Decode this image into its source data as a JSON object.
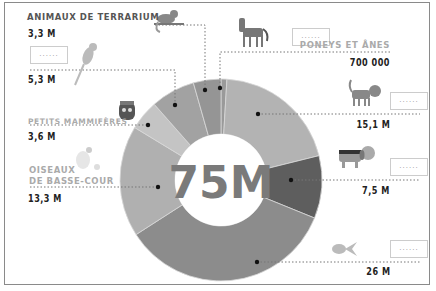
{
  "chart_data": {
    "type": "pie",
    "style": "donut",
    "title": "75M",
    "total_label": "75M",
    "categories": [
      "Poneys et ânes",
      "Chats",
      "Chiens",
      "Poissons",
      "Oiseaux de basse-cour",
      "Petits mammifères",
      "Oiseaux",
      "Animaux de terrarium"
    ],
    "values": [
      0.7,
      15.1,
      7.5,
      26,
      13.3,
      3.6,
      5.3,
      3.3
    ],
    "value_labels": [
      "700 000",
      "15,1 M",
      "7,5 M",
      "26 M",
      "13,3 M",
      "3,6 M",
      "5,3 M",
      "3,3 M"
    ],
    "colors": [
      "#9a9a9a",
      "#b3b3b3",
      "#5e5e5e",
      "#8c8c8c",
      "#b0b0b0",
      "#c4c4c4",
      "#a2a2a2",
      "#959595"
    ],
    "legend_position": "around, with leader lines"
  },
  "center": {
    "text": "75M"
  },
  "labels": {
    "terrarium": {
      "name": "ANIMAUX DE TERRARIUM",
      "value": "3,3 M"
    },
    "birds": {
      "name": "",
      "value": "5,3 M",
      "box": "......"
    },
    "small_mammals": {
      "name": "PETITS MAMMIFÈRES",
      "value": "3,6 M"
    },
    "poultry": {
      "name1": "OISEAUX",
      "name2": "DE BASSE-COUR",
      "value": "13,3 M"
    },
    "ponies": {
      "name": "PONEYS ET ÂNES",
      "value": "700 000",
      "box": "......"
    },
    "cats": {
      "name": "",
      "value": "15,1 M",
      "box": "......"
    },
    "dogs": {
      "name": "",
      "value": "7,5 M",
      "box": "......"
    },
    "fish": {
      "name": "",
      "value": "26 M",
      "box": "......"
    }
  }
}
